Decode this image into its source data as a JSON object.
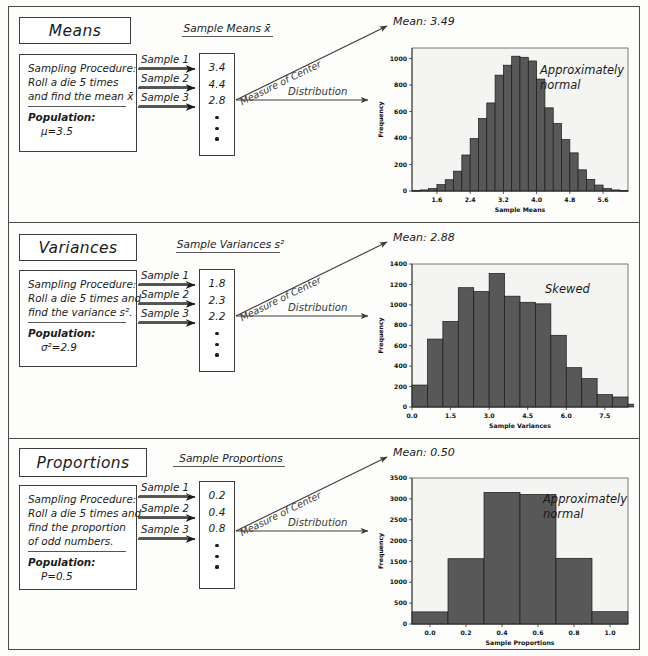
{
  "figure": {
    "bar_color": "#585858",
    "bar_stroke": "#1a1a1a",
    "plot_bg": "#f4f4f2",
    "frame_color": "#4a4a4a"
  },
  "common": {
    "sample_labels": [
      "Sample 1",
      "Sample 2",
      "Sample 3"
    ],
    "measure_of_center_label": "Measure of Center",
    "distribution_label": "Distribution",
    "population_label": "Population:",
    "procedure_label": "Sampling Procedure:"
  },
  "panels": [
    {
      "id": "means",
      "title": "Means",
      "procedure_lines": [
        "Sampling Procedure:",
        "Roll a die 5 times",
        "and find the mean x̄"
      ],
      "population_label": "Population:",
      "population_value": "μ=3.5",
      "column_header": "Sample Means x̄",
      "values": [
        "3.4",
        "4.4",
        "2.8"
      ],
      "mean_label": "Mean: 3.49",
      "shape_note": "Approximately\nnormal"
    },
    {
      "id": "variances",
      "title": "Variances",
      "procedure_lines": [
        "Sampling Procedure:",
        "Roll a die 5 times and",
        "find the variance s²."
      ],
      "population_label": "Population:",
      "population_value": "σ²=2.9",
      "column_header": "Sample Variances s²",
      "values": [
        "1.8",
        "2.3",
        "2.2"
      ],
      "mean_label": "Mean: 2.88",
      "shape_note": "Skewed"
    },
    {
      "id": "proportions",
      "title": "Proportions",
      "procedure_lines": [
        "Sampling Procedure:",
        "Roll a die 5 times and",
        "find the proportion",
        "of odd numbers."
      ],
      "population_label": "Population:",
      "population_value": "P=0.5",
      "column_header": "Sample Proportions",
      "values": [
        "0.2",
        "0.4",
        "0.8"
      ],
      "mean_label": "Mean: 0.50",
      "shape_note": "Approximately\nnormal"
    }
  ],
  "chart_data": [
    {
      "type": "bar",
      "id": "means-histogram",
      "title": "",
      "xlabel": "Sample Means",
      "ylabel": "Frequency",
      "xlim": [
        1.0,
        6.2
      ],
      "ylim": [
        0,
        1080
      ],
      "xticks": [
        "1.6",
        "2.4",
        "3.2",
        "4.0",
        "4.8",
        "5.6"
      ],
      "xtick_values": [
        1.6,
        2.4,
        3.2,
        4.0,
        4.8,
        5.6
      ],
      "yticks": [
        "0",
        "200",
        "400",
        "600",
        "800",
        "1000"
      ],
      "ytick_values": [
        0,
        200,
        400,
        600,
        800,
        1000
      ],
      "bin_width": 0.2,
      "bin_starts": [
        1.0,
        1.2,
        1.4,
        1.6,
        1.8,
        2.0,
        2.2,
        2.4,
        2.6,
        2.8,
        3.0,
        3.2,
        3.4,
        3.6,
        3.8,
        4.0,
        4.2,
        4.4,
        4.6,
        4.8,
        5.0,
        5.2,
        5.4,
        5.6,
        5.8,
        6.0
      ],
      "values": [
        3,
        8,
        18,
        48,
        85,
        150,
        272,
        396,
        548,
        665,
        875,
        950,
        1018,
        1010,
        982,
        845,
        628,
        510,
        388,
        288,
        160,
        88,
        45,
        18,
        8,
        3
      ],
      "grid": false,
      "annotation": "Approximately normal"
    },
    {
      "type": "bar",
      "id": "variances-histogram",
      "title": "",
      "xlabel": "Sample Variances",
      "ylabel": "Frequency",
      "xlim": [
        0.0,
        8.4
      ],
      "ylim": [
        0,
        1400
      ],
      "xticks": [
        "0.0",
        "1.5",
        "3.0",
        "4.5",
        "6.0",
        "7.5"
      ],
      "xtick_values": [
        0.0,
        1.5,
        3.0,
        4.5,
        6.0,
        7.5
      ],
      "yticks": [
        "0",
        "200",
        "400",
        "600",
        "800",
        "1000",
        "1200",
        "1400"
      ],
      "ytick_values": [
        0,
        200,
        400,
        600,
        800,
        1000,
        1200,
        1400
      ],
      "bin_width": 0.6,
      "bin_starts": [
        0.0,
        0.6,
        1.2,
        1.8,
        2.4,
        3.0,
        3.6,
        4.2,
        4.8,
        5.4,
        6.0,
        6.6,
        7.2,
        7.8
      ],
      "values": [
        215,
        665,
        838,
        1168,
        1130,
        1308,
        1085,
        1025,
        1010,
        702,
        385,
        278,
        122,
        98
      ],
      "extra_bin_start": 8.4,
      "extra_bin_value": 28,
      "grid": false,
      "annotation": "Skewed"
    },
    {
      "type": "bar",
      "id": "proportions-histogram",
      "title": "",
      "xlabel": "Sample Proportions",
      "ylabel": "Frequency",
      "xlim": [
        -0.1,
        1.1
      ],
      "ylim": [
        0,
        3500
      ],
      "xticks": [
        "0.0",
        "0.2",
        "0.4",
        "0.6",
        "0.8",
        "1.0"
      ],
      "xtick_values": [
        0.0,
        0.2,
        0.4,
        0.6,
        0.8,
        1.0
      ],
      "yticks": [
        "0",
        "500",
        "1000",
        "1500",
        "2000",
        "2500",
        "3000",
        "3500"
      ],
      "ytick_values": [
        0,
        500,
        1000,
        1500,
        2000,
        2500,
        3000,
        3500
      ],
      "bin_width": 0.2,
      "bin_starts": [
        -0.1,
        0.1,
        0.3,
        0.5,
        0.7,
        0.9
      ],
      "values": [
        290,
        1565,
        3155,
        3105,
        1575,
        295
      ],
      "grid": false,
      "annotation": "Approximately normal"
    }
  ]
}
